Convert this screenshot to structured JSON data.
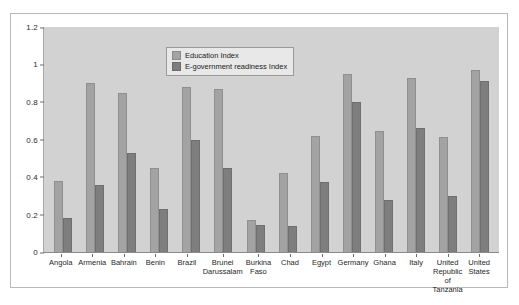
{
  "chart_data": {
    "type": "bar",
    "title": "",
    "xlabel": "",
    "ylabel": "",
    "ylim": [
      0,
      1.2
    ],
    "yticks": [
      "0",
      "0.2",
      "0.4",
      "0.6",
      "0.8",
      "1",
      "1.2"
    ],
    "grid": false,
    "legend_position": "top-center",
    "categories": [
      "Angola",
      "Armenia",
      "Bahrain",
      "Benin",
      "Brazil",
      "Brunei Darussalam",
      "Burkina Faso",
      "Chad",
      "Egypt",
      "Germany",
      "Ghana",
      "Italy",
      "United Republic of Tanzania",
      "United States"
    ],
    "series": [
      {
        "name": "Education Index",
        "color": "#a3a3a3",
        "values": [
          0.38,
          0.9,
          0.85,
          0.45,
          0.88,
          0.87,
          0.17,
          0.42,
          0.62,
          0.95,
          0.645,
          0.93,
          0.615,
          0.97
        ]
      },
      {
        "name": "E-government readiness Index",
        "color": "#7e7e7e",
        "values": [
          0.18,
          0.36,
          0.53,
          0.23,
          0.595,
          0.45,
          0.145,
          0.14,
          0.375,
          0.8,
          0.28,
          0.66,
          0.3,
          0.91
        ]
      }
    ]
  },
  "legend": {
    "items": [
      {
        "label": "Education Index"
      },
      {
        "label": "E-government readiness Index"
      }
    ]
  },
  "colors": {
    "plot_background": "#d2d2d2",
    "page_background": "#ffffff",
    "education_bar": "#a3a3a3",
    "readiness_bar": "#7e7e7e",
    "axis": "#6e6e6e",
    "frame": "#b9b9b9"
  }
}
